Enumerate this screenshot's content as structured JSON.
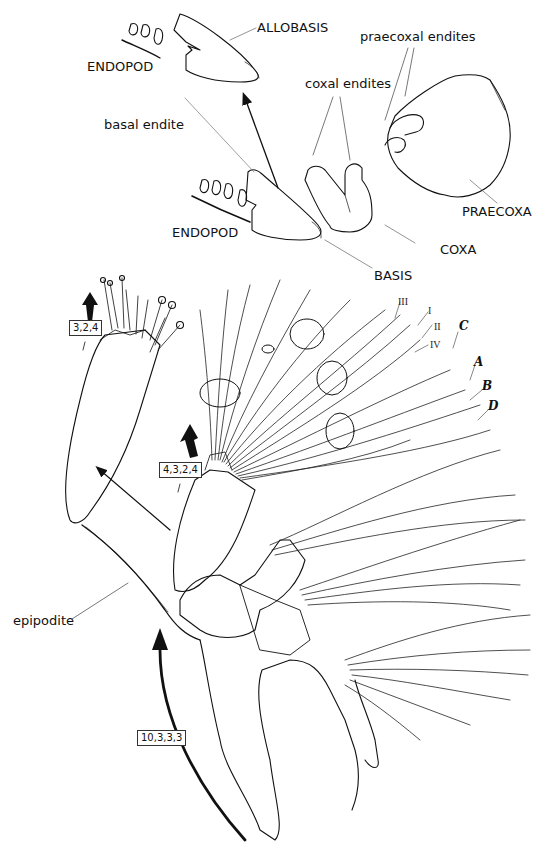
{
  "figure": {
    "type": "anatomical line drawing of crustacean limb (thoracopod) with segment labels",
    "colors": {
      "line": "#111111",
      "thin_line": "#555555",
      "background": "#ffffff"
    }
  },
  "labels": {
    "allobasis": "ALLOBASIS",
    "endopod_top": "ENDOPOD",
    "praecoxal_endites": "praecoxal endites",
    "coxal_endites": "coxal endites",
    "basal_endite": "basal endite",
    "praecoxa": "PRAECOXA",
    "endopod_mid": "ENDOPOD",
    "coxa": "COXA",
    "basis": "BASIS",
    "epipodite": "epipodite"
  },
  "setae_labels": {
    "roman": [
      "III",
      "I",
      "II",
      "IV"
    ],
    "letters": [
      "C",
      "A",
      "B",
      "D"
    ]
  },
  "formula_boxes": [
    {
      "id": "endopod-detail",
      "text": "3,2,4"
    },
    {
      "id": "endopod-main",
      "text": "4,3,2,4"
    },
    {
      "id": "limb-base",
      "text": "10,3,3,3"
    }
  ]
}
